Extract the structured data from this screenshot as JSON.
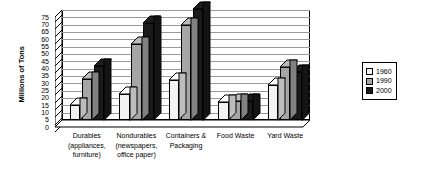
{
  "chart_data": {
    "type": "bar",
    "title": "",
    "xlabel": "",
    "ylabel": "Millions of Tons",
    "ylim": [
      0,
      75
    ],
    "ytick_step": 5,
    "yticks": [
      0,
      5,
      10,
      15,
      20,
      25,
      30,
      35,
      40,
      45,
      50,
      55,
      60,
      65,
      70,
      75
    ],
    "grid": true,
    "legend_position": "right",
    "style": "3d-grouped-bar",
    "categories": [
      "Durables (appliances, furniture)",
      "Nondurables (newspapers, office paper)",
      "Containers & Packaging",
      "Food Waste",
      "Yard Waste"
    ],
    "category_lines": [
      [
        "Durables",
        "(appliances,",
        "furniture)"
      ],
      [
        "Nondurables",
        "(newspapers,",
        "office paper)"
      ],
      [
        "Containers &",
        "Packaging"
      ],
      [
        "Food Waste"
      ],
      [
        "Yard Waste"
      ]
    ],
    "series": [
      {
        "name": "1960",
        "color": "#f2f2f2",
        "values": [
          10,
          18,
          27,
          12,
          24
        ]
      },
      {
        "name": "1990",
        "color": "#a6a6a6",
        "values": [
          28,
          52,
          65,
          13,
          36
        ]
      },
      {
        "name": "2000",
        "color": "#1a1a1a",
        "values": [
          37,
          66,
          76,
          13,
          33
        ]
      }
    ]
  },
  "legend": {
    "items": [
      {
        "label": "1960",
        "color": "#f2f2f2"
      },
      {
        "label": "1990",
        "color": "#a6a6a6"
      },
      {
        "label": "2000",
        "color": "#1a1a1a"
      }
    ]
  },
  "colors": {
    "axis": "#000000",
    "gridline": "#9a9a9a",
    "plot_background": "#ffffff",
    "page_background": "#ffffff"
  }
}
